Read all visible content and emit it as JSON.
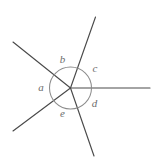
{
  "figure": {
    "kind": "angles-at-a-point",
    "canvas": {
      "width": 153,
      "height": 164,
      "background": "#ffffff"
    },
    "vertex": {
      "x": 70.5,
      "y": 88.0
    },
    "circle": {
      "cx": 70.5,
      "cy": 88.0,
      "r": 21.0,
      "stroke": "#8c8c8c",
      "stroke_width": 1.05,
      "fill": "none"
    },
    "style": {
      "ray_stroke": "#4a4a4a",
      "ray_stroke_width": 1.15,
      "label_color": "#6d6d6d",
      "label_font_size": 11
    },
    "rays": [
      {
        "name": "ray-upper-left",
        "end_x": 13.0,
        "end_y": 42.0,
        "direction": "up-left"
      },
      {
        "name": "ray-upper-right",
        "end_x": 95.5,
        "end_y": 17.0,
        "direction": "up-right"
      },
      {
        "name": "ray-right-horizontal",
        "end_x": 150.0,
        "end_y": 88.0,
        "direction": "right"
      },
      {
        "name": "ray-lower-right",
        "end_x": 94.0,
        "end_y": 156.0,
        "direction": "down-right"
      },
      {
        "name": "ray-lower-left",
        "end_x": 13.0,
        "end_y": 131.0,
        "direction": "down-left"
      }
    ],
    "angle_labels": [
      {
        "name": "angle-label-a",
        "text": "a",
        "x": 41.0,
        "y": 88.0
      },
      {
        "name": "angle-label-b",
        "text": "b",
        "x": 62.5,
        "y": 60.0
      },
      {
        "name": "angle-label-c",
        "text": "c",
        "x": 95.0,
        "y": 69.5
      },
      {
        "name": "angle-label-d",
        "text": "d",
        "x": 94.5,
        "y": 104.5
      },
      {
        "name": "angle-label-e",
        "text": "e",
        "x": 62.5,
        "y": 114.5
      }
    ]
  },
  "chart_data": {
    "type": "diagram",
    "categories": [
      "a",
      "b",
      "c",
      "d",
      "e"
    ],
    "values": [
      75,
      64,
      55,
      75,
      91
    ],
    "units": "degrees",
    "note": "Angle measures estimated from ray bearings; they sum to 360."
  }
}
